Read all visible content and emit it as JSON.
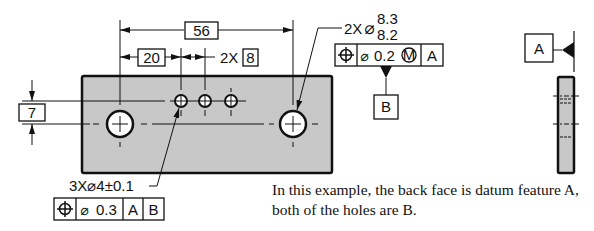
{
  "drawing": {
    "part": {
      "fill": "#c8c8c8",
      "stroke": "#111111"
    },
    "dimensions": {
      "overall_hole_spacing": "56",
      "first_small_hole_offset": "20",
      "small_hole_spacing_count": "2X",
      "small_hole_spacing": "8",
      "vertical_offset": "7"
    },
    "large_holes_callout": {
      "count": "2X",
      "diameter_symbol": "⌀",
      "upper_limit": "8.3",
      "lower_limit": "8.2",
      "fcf": {
        "symbol": "position",
        "tolerance_prefix": "⌀",
        "tolerance": "0.2",
        "modifier": "M",
        "datum_1": "A"
      },
      "datum_feature_label": "B"
    },
    "small_holes_callout": {
      "text": "3X⌀4±0.1",
      "fcf": {
        "symbol": "position",
        "tolerance_prefix": "⌀",
        "tolerance": "0.3",
        "datum_1": "A",
        "datum_2": "B"
      }
    },
    "side_view": {
      "datum_feature_label": "A"
    }
  },
  "caption": {
    "line1": "In this example, the back face is datum feature A,",
    "line2": "both of the holes are B."
  }
}
